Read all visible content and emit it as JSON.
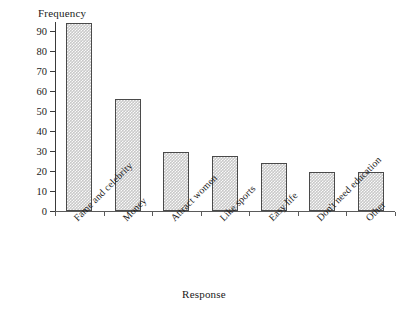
{
  "chart_data": {
    "type": "bar",
    "title": "",
    "xlabel": "Response",
    "ylabel": "Frequency",
    "categories": [
      "Fame and celebrity",
      "Money",
      "Attract women",
      "Like sports",
      "Easy life",
      "Don't need education",
      "Other"
    ],
    "values": [
      94,
      56,
      29.5,
      27.5,
      24,
      19.5,
      19.5
    ],
    "ylim": [
      0,
      95
    ],
    "yticks": [
      0,
      10,
      20,
      30,
      40,
      50,
      60,
      70,
      80,
      90
    ],
    "ytick_labels": [
      "0",
      "10",
      "20",
      "30",
      "40",
      "50",
      "60",
      "70",
      "80",
      "90"
    ],
    "grid": false,
    "legend": false,
    "bar_fill_color": "#c9c9c9",
    "bar_edge_color": "#4a4a4a",
    "axis_color": "#3a3a3a",
    "background_color": "#ffffff"
  }
}
